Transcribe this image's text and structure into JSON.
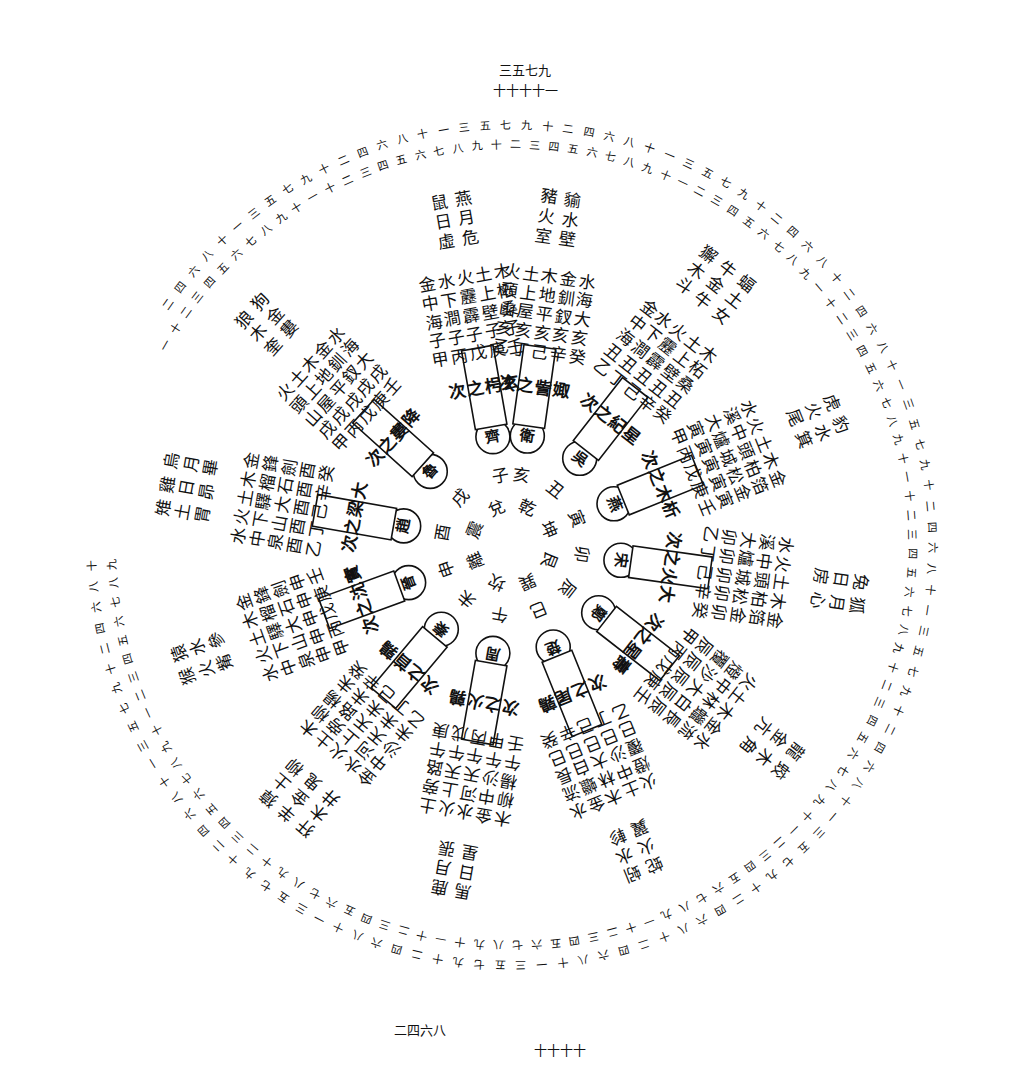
{
  "diagram": {
    "type": "circular star-station diagram (hand-drawn)",
    "center": [
      512,
      545
    ],
    "colors": {
      "ink": "#111111",
      "paper": "#ffffff"
    },
    "rings": {
      "inner_numeral_ring": "一十二三四五六七八九十一十二三四五六七八九十二三四五六七八九十一二三四五六七八九",
      "outer_numeral_ring": "二四六八十一三五七九十二四六八十一三五七九十二四六八十一三五七九十二四六八十"
    },
    "sectors": [
      {
        "angle": -82,
        "box": "次之訾娵",
        "state": "衛",
        "branch": "亥",
        "radial": [
          "乙亥山頭火",
          "丁亥屋上土",
          "己亥平地木",
          "辛亥釵釧金",
          "癸亥大海水"
        ],
        "mansions": [
          "室火豬",
          "壁水貐"
        ]
      },
      {
        "angle": -100,
        "box": "次之枵玄",
        "state": "齊",
        "branch": "子",
        "radial": [
          "甲子海中金",
          "丙子澗下水",
          "戊子霹靂火",
          "庚子壁上土",
          "壬子桑柘木"
        ],
        "mansions": [
          "虛日鼠",
          "危月燕"
        ]
      },
      {
        "angle": -52,
        "box": "次之紀星",
        "state": "吳",
        "branch": "丑",
        "radial": [
          "乙丑海中金",
          "丁丑澗下水",
          "己丑霹靂火",
          "辛丑壁上土",
          "癸丑桑柘木"
        ],
        "mansions": [
          "斗木獬",
          "牛金牛",
          "女土蝠"
        ]
      },
      {
        "angle": -22,
        "box": "次之木析",
        "state": "燕",
        "branch": "寅",
        "radial": [
          "甲寅大溪水",
          "丙寅爐中火",
          "戊寅城頭土",
          "庚寅松柏木",
          "壬寅金箔金"
        ],
        "mansions": [
          "尾火虎",
          "箕水豹"
        ]
      },
      {
        "angle": 8,
        "box": "次之火大",
        "state": "宋",
        "branch": "卯",
        "radial": [
          "乙卯大溪水",
          "丁卯爐中火",
          "己卯城頭土",
          "辛卯松柏木",
          "癸卯金箔金"
        ],
        "mansions": [
          "房日兔",
          "心月狐"
        ]
      },
      {
        "angle": 38,
        "box": "次之星壽",
        "state": "鄭",
        "branch": "辰",
        "radial": [
          "甲辰覆燈火",
          "丙辰沙中土",
          "戊辰大林木",
          "庚辰白蠟金",
          "壬辰長流水"
        ],
        "mansions": [
          "亢金龍",
          "角木蛟"
        ]
      },
      {
        "angle": 68,
        "box": "次之尾鶉",
        "state": "楚",
        "branch": "巳",
        "radial": [
          "乙巳覆燈火",
          "丁巳沙中土",
          "己巳大林木",
          "辛巳白蠟金",
          "癸巳長流水"
        ],
        "mansions": [
          "翼火蛇",
          "軫水蚓"
        ]
      },
      {
        "angle": 100,
        "box": "次之火鶉",
        "state": "周",
        "branch": "午",
        "radial": [
          "壬午楊柳木",
          "甲午沙中金",
          "丙午天河水",
          "戊午天上火",
          "庚午路旁土"
        ],
        "mansions": [
          "星日馬",
          "張月鹿"
        ]
      },
      {
        "angle": 130,
        "box": "次之首鶉",
        "state": "秦",
        "branch": "未",
        "radial": [
          "乙未沙中金",
          "丁未天河水",
          "己未天上火",
          "辛未路旁土",
          "癸未楊柳木"
        ],
        "mansions": [
          "井木犴",
          "鬼金羊",
          "柳土獐"
        ]
      },
      {
        "angle": 160,
        "box": "次之沈實",
        "state": "晉",
        "branch": "申",
        "radial": [
          "甲申泉中水",
          "丙申山下火",
          "戊申大驛土",
          "庚申石榴木",
          "壬申劍鋒金"
        ],
        "mansions": [
          "觜火猴",
          "參水猿"
        ]
      },
      {
        "angle": 190,
        "box": "次之梁大",
        "state": "趙",
        "branch": "酉",
        "radial": [
          "乙酉泉中水",
          "丁酉山下火",
          "己酉大驛土",
          "辛酉石榴木",
          "癸酉劍鋒金"
        ],
        "mansions": [
          "胃土雉",
          "昴日雞",
          "畢月烏"
        ]
      },
      {
        "angle": 222,
        "box": "次之婁降",
        "state": "魯",
        "branch": "戌",
        "radial": [
          "甲戌山頭火",
          "丙戌屋上土",
          "戊戌平地木",
          "庚戌釵釧金",
          "壬戌大海水"
        ],
        "mansions": [
          "奎木狼",
          "婁金狗"
        ]
      }
    ],
    "inner_labels": [
      "乾",
      "坤",
      "艮",
      "巽",
      "坎",
      "離",
      "震",
      "兌"
    ],
    "outer_marks": [
      "三五七九",
      "十十十十一",
      "二四六八",
      "十十十十"
    ]
  }
}
